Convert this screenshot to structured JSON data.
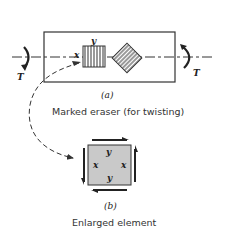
{
  "figure": {
    "part_a": {
      "label": "(a)",
      "caption": "Marked eraser (for twisting)",
      "torque_left": "T",
      "torque_right": "T",
      "axis_x": "x",
      "axis_y": "y"
    },
    "part_b": {
      "label": "(b)",
      "caption": "Enlarged element",
      "label_top": "y",
      "label_bottom": "y",
      "label_left": "x",
      "label_right": "x"
    },
    "colors": {
      "stroke": "#333333",
      "element_fill": "#c9c9c9",
      "hatch": "#555555"
    }
  }
}
